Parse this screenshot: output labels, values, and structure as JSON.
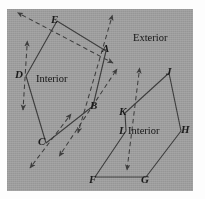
{
  "figure": {
    "type": "geometry-diagram",
    "background_color": "#9a9a9a",
    "stroke_color": "#3b3b3b",
    "canvas": {
      "width": 205,
      "height": 199
    },
    "panel": {
      "x": 7,
      "y": 9,
      "width": 186,
      "height": 182
    }
  },
  "labels": {
    "regions": [
      {
        "name": "interior-left",
        "text": "Interior",
        "x": 36,
        "y": 74
      },
      {
        "name": "exterior",
        "text": "Exterior",
        "x": 133,
        "y": 33
      },
      {
        "name": "interior-right",
        "text": "Interior",
        "x": 128,
        "y": 126
      }
    ],
    "points": [
      {
        "id": "E",
        "text": "E",
        "x": 51,
        "y": 14
      },
      {
        "id": "A",
        "text": "A",
        "x": 102,
        "y": 43
      },
      {
        "id": "D",
        "text": "D",
        "x": 15,
        "y": 69
      },
      {
        "id": "J",
        "text": "J",
        "x": 166,
        "y": 66
      },
      {
        "id": "B",
        "text": "B",
        "x": 90,
        "y": 100
      },
      {
        "id": "K",
        "text": "K",
        "x": 119,
        "y": 106
      },
      {
        "id": "H",
        "text": "H",
        "x": 181,
        "y": 124
      },
      {
        "id": "L",
        "text": "L",
        "x": 119,
        "y": 125
      },
      {
        "id": "C",
        "text": "C",
        "x": 38,
        "y": 136
      },
      {
        "id": "F",
        "text": "F",
        "x": 89,
        "y": 174
      },
      {
        "id": "G",
        "text": "G",
        "x": 141,
        "y": 174
      }
    ]
  },
  "chart_data": {
    "type": "diagram",
    "polygons": [
      {
        "name": "left-polygon",
        "label": "Interior",
        "vertices": [
          {
            "id": "E",
            "x": 57,
            "y": 21
          },
          {
            "id": "A",
            "x": 106,
            "y": 51
          },
          {
            "id": "B",
            "x": 93,
            "y": 106
          },
          {
            "id": "C",
            "x": 46,
            "y": 143
          },
          {
            "id": "D",
            "x": 26,
            "y": 76
          }
        ]
      },
      {
        "name": "right-polygon",
        "label": "Interior",
        "vertices": [
          {
            "id": "J",
            "x": 169,
            "y": 73
          },
          {
            "id": "H",
            "x": 181,
            "y": 131
          },
          {
            "id": "G",
            "x": 146,
            "y": 177
          },
          {
            "id": "F",
            "x": 95,
            "y": 177
          },
          {
            "id": "L",
            "x": 126,
            "y": 131
          },
          {
            "id": "K",
            "x": 125,
            "y": 113
          }
        ]
      }
    ],
    "arrows": [
      {
        "name": "arrow-through-E",
        "x1": 22,
        "y1": 15,
        "x2": 113,
        "y2": 63,
        "heads": "both"
      },
      {
        "name": "arrow-through-D",
        "x1": 27,
        "y1": 46,
        "x2": 23,
        "y2": 110,
        "heads": "both"
      },
      {
        "name": "arrow-through-A-B",
        "x1": 111,
        "y1": 20,
        "x2": 78,
        "y2": 133,
        "heads": "both"
      },
      {
        "name": "arrow-through-B-A",
        "x1": 62,
        "y1": 152,
        "x2": 117,
        "y2": 69,
        "heads": "both"
      },
      {
        "name": "arrow-through-C",
        "x1": 68,
        "y1": 118,
        "x2": 30,
        "y2": 168,
        "heads": "both"
      },
      {
        "name": "arrow-through-K-L",
        "x1": 139,
        "y1": 73,
        "x2": 127,
        "y2": 170,
        "heads": "both"
      }
    ]
  }
}
